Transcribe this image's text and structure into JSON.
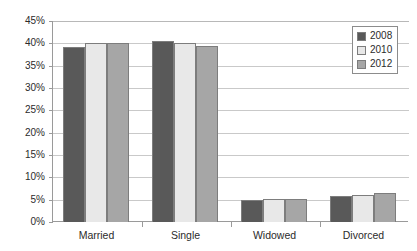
{
  "chart_data": {
    "type": "bar",
    "title": "",
    "subtitle": "",
    "xlabel": "",
    "ylabel": "",
    "categories": [
      "Married",
      "Single",
      "Widowed",
      "Divorced"
    ],
    "series": [
      {
        "name": "2008",
        "color": "#595959",
        "values": [
          39.2,
          40.6,
          5.0,
          5.8
        ]
      },
      {
        "name": "2010",
        "color": "#E8E8E8",
        "values": [
          40.0,
          40.0,
          5.1,
          6.0
        ]
      },
      {
        "name": "2012",
        "color": "#A6A6A6",
        "values": [
          40.0,
          39.5,
          5.2,
          6.6
        ]
      }
    ],
    "ylim": [
      0,
      45
    ],
    "ytick_values": [
      0,
      5,
      10,
      15,
      20,
      25,
      30,
      35,
      40,
      45
    ],
    "ytick_labels": [
      "0%",
      "5%",
      "10%",
      "15%",
      "20%",
      "25%",
      "30%",
      "35%",
      "40%",
      "45%"
    ],
    "grid": true,
    "legend_position": "top-right",
    "legend_entries": [
      "2008",
      "2010",
      "2012"
    ]
  },
  "axis": {
    "yticks": [
      {
        "label": "45%",
        "value": 45
      },
      {
        "label": "40%",
        "value": 40
      },
      {
        "label": "35%",
        "value": 35
      },
      {
        "label": "30%",
        "value": 30
      },
      {
        "label": "25%",
        "value": 25
      },
      {
        "label": "20%",
        "value": 20
      },
      {
        "label": "15%",
        "value": 15
      },
      {
        "label": "10%",
        "value": 10
      },
      {
        "label": "5%",
        "value": 5
      },
      {
        "label": "0%",
        "value": 0
      }
    ]
  },
  "colors": {
    "series_2008": "#595959",
    "series_2010": "#E8E8E8",
    "series_2012": "#A6A6A6",
    "gridline": "#C9C9C9",
    "axis": "#9A9A9A",
    "bar_outline": "#7D7D7D",
    "text": "#2B2B2B",
    "background": "#FFFFFF"
  }
}
